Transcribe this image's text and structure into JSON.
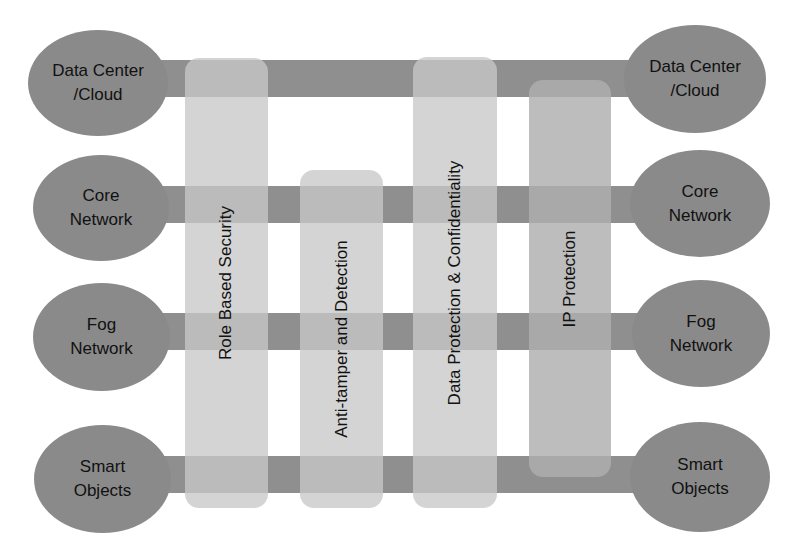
{
  "diagram": {
    "title": "",
    "layers_left": [
      {
        "id": "dc",
        "label": "Data Center\n/Cloud"
      },
      {
        "id": "core",
        "label": "Core\nNetwork"
      },
      {
        "id": "fog",
        "label": "Fog\nNetwork"
      },
      {
        "id": "smart",
        "label": "Smart\nObjects"
      }
    ],
    "layers_right": [
      {
        "id": "dc",
        "label": "Data Center\n/Cloud"
      },
      {
        "id": "core",
        "label": "Core\nNetwork"
      },
      {
        "id": "fog",
        "label": "Fog\nNetwork"
      },
      {
        "id": "smart",
        "label": "Smart\nObjects"
      }
    ],
    "security_columns": [
      {
        "id": "rbs",
        "label": "Role Based Security",
        "spans": [
          "Data Center/Cloud",
          "Core Network",
          "Fog Network",
          "Smart Objects"
        ]
      },
      {
        "id": "atd",
        "label": "Anti-tamper and Detection",
        "spans": [
          "Core Network",
          "Fog Network",
          "Smart Objects"
        ]
      },
      {
        "id": "dpc",
        "label": "Data Protection & Confidentiality",
        "spans": [
          "Data Center/Cloud",
          "Core Network",
          "Fog Network",
          "Smart Objects"
        ]
      },
      {
        "id": "ipp",
        "label": "IP Protection",
        "spans": [
          "Data Center/Cloud",
          "Core Network",
          "Fog Network",
          "Smart Objects"
        ]
      }
    ],
    "colors": {
      "node": "#8a8a8a",
      "bar": "#8f8f8f",
      "column": "#c8c8c8",
      "column_ip": "#afafaf",
      "text": "#111111",
      "background": "#ffffff"
    }
  }
}
